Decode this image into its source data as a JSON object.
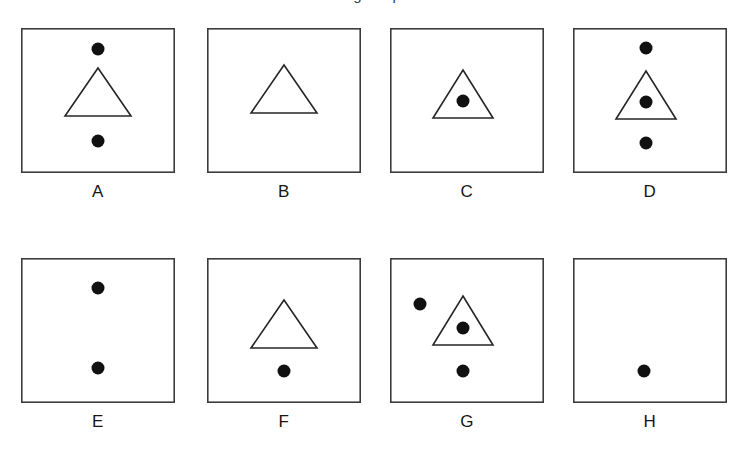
{
  "figure": {
    "caption": "Using Shapes",
    "background_color": "#ffffff",
    "stroke_color": "#3c3c3c",
    "shape_stroke_color": "#262626",
    "dot_color": "#111111",
    "panel_width": 154,
    "panel_height": 145,
    "rows": 2,
    "columns": 4
  },
  "panels": [
    {
      "label": "A",
      "x": 21,
      "y": 28,
      "shapes": {
        "triangle": {
          "present": true,
          "apex_x": 77,
          "apex_y": 40,
          "left_x": 44,
          "right_x": 110,
          "base_y": 88
        },
        "dots": [
          {
            "name": "dot-above-triangle",
            "cx": 77,
            "cy": 21,
            "r": 6.5
          },
          {
            "name": "dot-below-triangle",
            "cx": 77,
            "cy": 113,
            "r": 6.5
          }
        ]
      },
      "dot_count": 2,
      "triangle_count": 1
    },
    {
      "label": "B",
      "x": 207,
      "y": 28,
      "shapes": {
        "triangle": {
          "present": true,
          "apex_x": 77,
          "apex_y": 37,
          "left_x": 44,
          "right_x": 110,
          "base_y": 85
        },
        "dots": []
      },
      "dot_count": 0,
      "triangle_count": 1
    },
    {
      "label": "C",
      "x": 390,
      "y": 28,
      "shapes": {
        "triangle": {
          "present": true,
          "apex_x": 73,
          "apex_y": 42,
          "left_x": 43,
          "right_x": 103,
          "base_y": 90
        },
        "dots": [
          {
            "name": "dot-inside-triangle",
            "cx": 73,
            "cy": 73,
            "r": 6.5
          }
        ]
      },
      "dot_count": 1,
      "triangle_count": 1
    },
    {
      "label": "D",
      "x": 573,
      "y": 28,
      "shapes": {
        "triangle": {
          "present": true,
          "apex_x": 73,
          "apex_y": 43,
          "left_x": 43,
          "right_x": 103,
          "base_y": 91
        },
        "dots": [
          {
            "name": "dot-above-triangle",
            "cx": 73,
            "cy": 20,
            "r": 6.5
          },
          {
            "name": "dot-inside-triangle",
            "cx": 73,
            "cy": 74,
            "r": 6.5
          },
          {
            "name": "dot-below-triangle",
            "cx": 73,
            "cy": 115,
            "r": 6.5
          }
        ]
      },
      "dot_count": 3,
      "triangle_count": 1
    },
    {
      "label": "E",
      "x": 21,
      "y": 258,
      "shapes": {
        "triangle": {
          "present": false
        },
        "dots": [
          {
            "name": "dot-upper",
            "cx": 77,
            "cy": 30,
            "r": 6.5
          },
          {
            "name": "dot-lower",
            "cx": 77,
            "cy": 110,
            "r": 6.5
          }
        ]
      },
      "dot_count": 2,
      "triangle_count": 0
    },
    {
      "label": "F",
      "x": 207,
      "y": 258,
      "shapes": {
        "triangle": {
          "present": true,
          "apex_x": 77,
          "apex_y": 42,
          "left_x": 44,
          "right_x": 110,
          "base_y": 90
        },
        "dots": [
          {
            "name": "dot-below-triangle",
            "cx": 77,
            "cy": 113,
            "r": 6.5
          }
        ]
      },
      "dot_count": 1,
      "triangle_count": 1
    },
    {
      "label": "G",
      "x": 390,
      "y": 258,
      "shapes": {
        "triangle": {
          "present": true,
          "apex_x": 73,
          "apex_y": 38,
          "left_x": 43,
          "right_x": 103,
          "base_y": 87
        },
        "dots": [
          {
            "name": "dot-outside-left",
            "cx": 30,
            "cy": 46,
            "r": 6.5
          },
          {
            "name": "dot-inside-triangle",
            "cx": 73,
            "cy": 70,
            "r": 6.5
          },
          {
            "name": "dot-below-triangle",
            "cx": 73,
            "cy": 113,
            "r": 6.5
          }
        ]
      },
      "dot_count": 3,
      "triangle_count": 1
    },
    {
      "label": "H",
      "x": 573,
      "y": 258,
      "shapes": {
        "triangle": {
          "present": false
        },
        "dots": [
          {
            "name": "dot-lower",
            "cx": 71,
            "cy": 113,
            "r": 6.5
          }
        ]
      },
      "dot_count": 1,
      "triangle_count": 0
    }
  ]
}
